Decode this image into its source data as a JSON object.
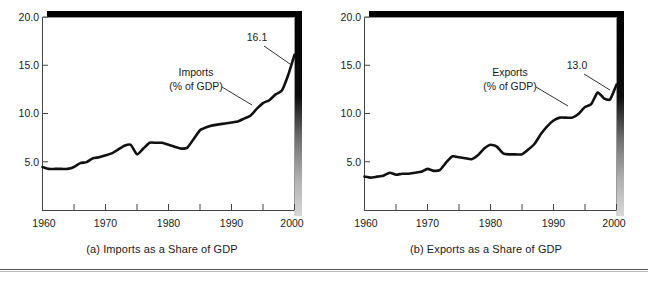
{
  "figure": {
    "panel_count": 2,
    "divider_color": "#555555"
  },
  "panel_a": {
    "caption": "(a) Imports as a Share of GDP",
    "annotation_line1": "Imports",
    "annotation_line2": "(% of GDP)",
    "endpoint_label": "16.1",
    "y_ticks": [
      "20.0",
      "15.0",
      "10.0",
      "5.0"
    ],
    "x_ticks": [
      "1960",
      "1970",
      "1980",
      "1990",
      "2000"
    ]
  },
  "panel_b": {
    "caption": "(b) Exports as a Share of GDP",
    "annotation_line1": "Exports",
    "annotation_line2": "(% of GDP)",
    "endpoint_label": "13.0",
    "y_ticks": [
      "20.0",
      "15.0",
      "10.0",
      "5.0"
    ],
    "x_ticks": [
      "1960",
      "1970",
      "1980",
      "1990",
      "2000"
    ]
  },
  "chart_data": [
    {
      "type": "line",
      "title": "(a) Imports as a Share of GDP",
      "xlabel": "",
      "ylabel": "",
      "series_label": "Imports (% of GDP)",
      "xlim": [
        1960,
        2000
      ],
      "ylim": [
        0,
        20
      ],
      "y_ticks": [
        5.0,
        10.0,
        15.0,
        20.0
      ],
      "y_tick_labels": [
        "5.0",
        "10.0",
        "15.0",
        "20.0"
      ],
      "x_ticks": [
        1960,
        1965,
        1970,
        1975,
        1980,
        1985,
        1990,
        1995,
        2000
      ],
      "x_tick_labels": [
        "1960",
        "",
        "1970",
        "",
        "1980",
        "",
        "1990",
        "",
        "2000"
      ],
      "grid": false,
      "legend": "none",
      "endpoint_annotation": {
        "x": 2000,
        "y": 16.1,
        "text": "16.1"
      },
      "x": [
        1960,
        1961,
        1962,
        1963,
        1964,
        1965,
        1966,
        1967,
        1968,
        1969,
        1970,
        1971,
        1972,
        1973,
        1974,
        1975,
        1976,
        1977,
        1978,
        1979,
        1980,
        1981,
        1982,
        1983,
        1984,
        1985,
        1986,
        1987,
        1988,
        1989,
        1990,
        1991,
        1992,
        1993,
        1994,
        1995,
        1996,
        1997,
        1998,
        1999,
        2000
      ],
      "y": [
        4.5,
        4.3,
        4.3,
        4.3,
        4.3,
        4.5,
        4.9,
        5.0,
        5.4,
        5.5,
        5.7,
        5.9,
        6.3,
        6.7,
        6.8,
        5.8,
        6.4,
        7.0,
        7.0,
        7.0,
        6.8,
        6.6,
        6.4,
        6.5,
        7.4,
        8.3,
        8.6,
        8.8,
        8.9,
        9.0,
        9.1,
        9.2,
        9.5,
        9.8,
        10.5,
        11.1,
        11.4,
        12.0,
        12.4,
        14.0,
        16.1
      ]
    },
    {
      "type": "line",
      "title": "(b) Exports as a Share of GDP",
      "xlabel": "",
      "ylabel": "",
      "series_label": "Exports (% of GDP)",
      "xlim": [
        1960,
        2000
      ],
      "ylim": [
        0,
        20
      ],
      "y_ticks": [
        5.0,
        10.0,
        15.0,
        20.0
      ],
      "y_tick_labels": [
        "5.0",
        "10.0",
        "15.0",
        "20.0"
      ],
      "x_ticks": [
        1960,
        1965,
        1970,
        1975,
        1980,
        1985,
        1990,
        1995,
        2000
      ],
      "x_tick_labels": [
        "1960",
        "",
        "1970",
        "",
        "1980",
        "",
        "1990",
        "",
        "2000"
      ],
      "grid": false,
      "legend": "none",
      "endpoint_annotation": {
        "x": 2000,
        "y": 13.0,
        "text": "13.0"
      },
      "x": [
        1960,
        1961,
        1962,
        1963,
        1964,
        1965,
        1966,
        1967,
        1968,
        1969,
        1970,
        1971,
        1972,
        1973,
        1974,
        1975,
        1976,
        1977,
        1978,
        1979,
        1980,
        1981,
        1982,
        1983,
        1984,
        1985,
        1986,
        1987,
        1988,
        1989,
        1990,
        1991,
        1992,
        1993,
        1994,
        1995,
        1996,
        1997,
        1998,
        1999,
        2000
      ],
      "y": [
        3.5,
        3.4,
        3.5,
        3.6,
        3.9,
        3.7,
        3.8,
        3.8,
        3.9,
        4.0,
        4.3,
        4.1,
        4.2,
        5.0,
        5.6,
        5.5,
        5.4,
        5.3,
        5.7,
        6.4,
        6.8,
        6.6,
        5.9,
        5.8,
        5.8,
        5.8,
        6.3,
        6.9,
        7.9,
        8.7,
        9.3,
        9.6,
        9.6,
        9.6,
        10.0,
        10.7,
        11.0,
        12.2,
        11.6,
        11.5,
        13.0
      ]
    }
  ]
}
